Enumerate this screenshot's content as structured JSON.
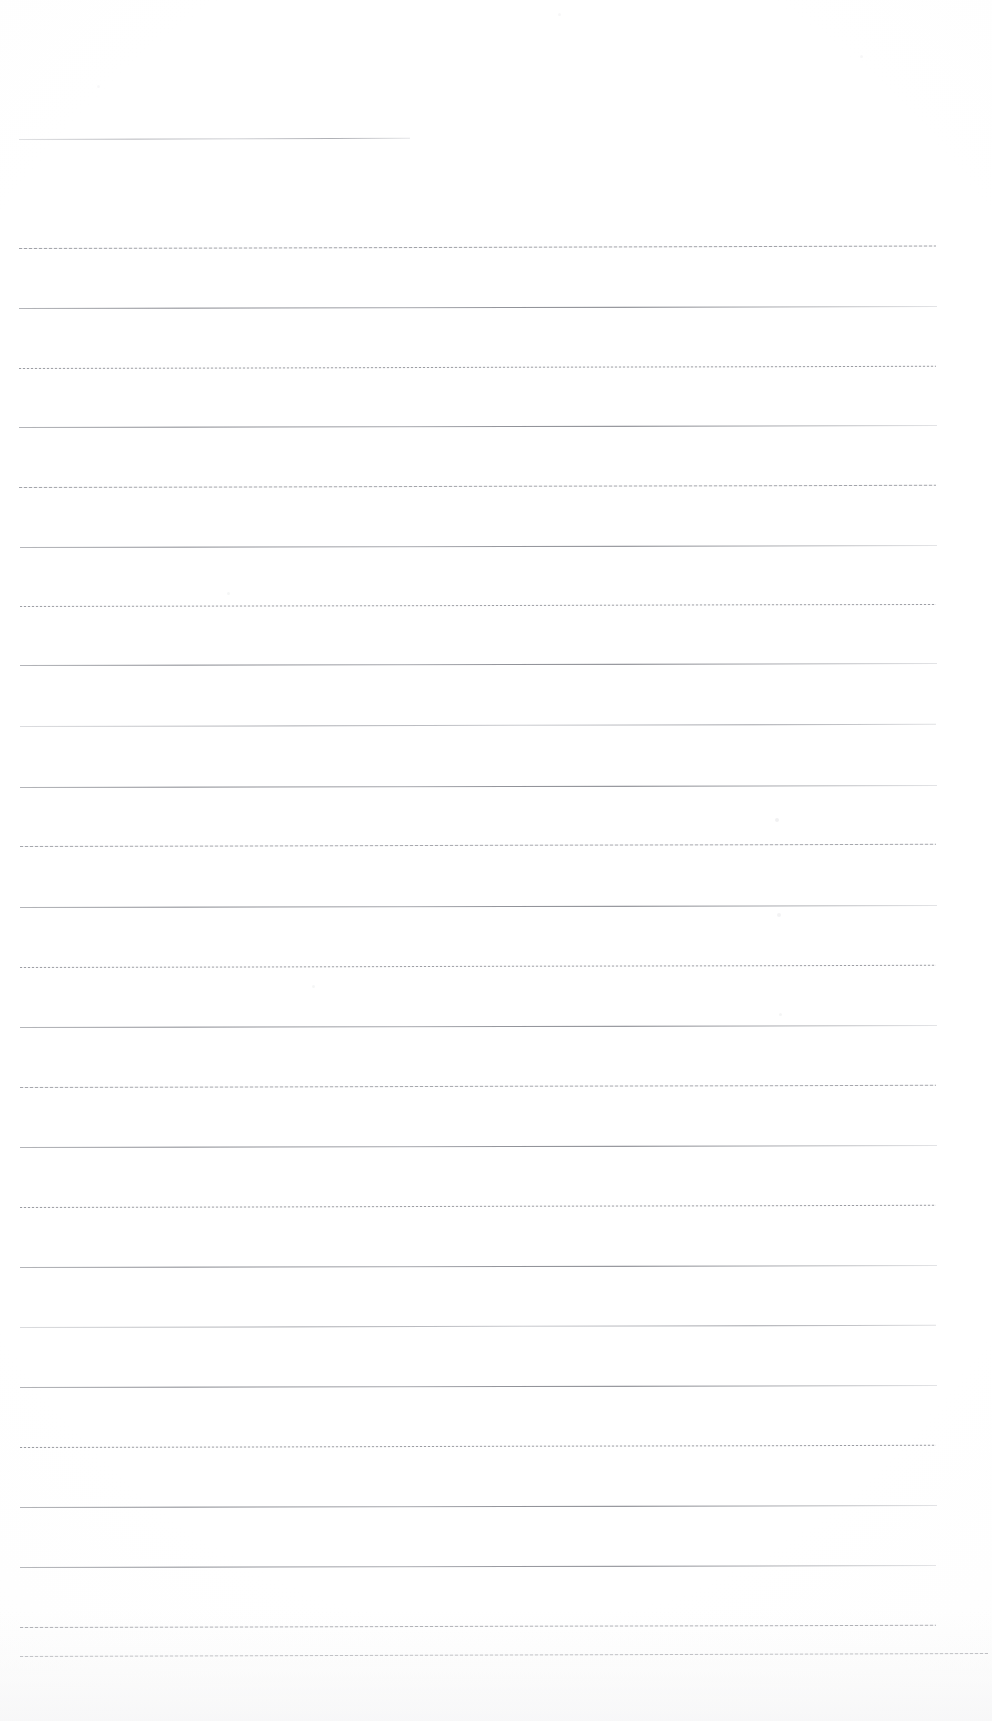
{
  "document": {
    "kind": "scanned-blank-ruled-page",
    "title": "",
    "background_color": "#ffffff",
    "rule_color": "#8a8c94",
    "page_width": 992,
    "page_height": 1721,
    "text_content": "",
    "visible_text": []
  },
  "rules": {
    "count": 28,
    "first_line_is_short": true,
    "short_line_right_edge": 410,
    "default_left_edge": 19,
    "default_right_edge": 937,
    "spacing": 60,
    "lines": [
      {
        "y": 139,
        "x1": 19,
        "x2": 410,
        "slant": -1.2,
        "texture": "fine",
        "opacity": 0.7
      },
      {
        "y": 248,
        "x1": 19,
        "x2": 936,
        "slant": -2.4,
        "texture": "mixed",
        "opacity": 0.85
      },
      {
        "y": 308,
        "x1": 19,
        "x2": 937,
        "slant": -2.0,
        "texture": "solid",
        "opacity": 0.95
      },
      {
        "y": 368,
        "x1": 19,
        "x2": 936,
        "slant": -2.2,
        "texture": "dotted",
        "opacity": 0.8
      },
      {
        "y": 427,
        "x1": 19,
        "x2": 937,
        "slant": -2.0,
        "texture": "solid",
        "opacity": 0.95
      },
      {
        "y": 487,
        "x1": 19,
        "x2": 936,
        "slant": -2.2,
        "texture": "mixed",
        "opacity": 0.82
      },
      {
        "y": 547,
        "x1": 20,
        "x2": 937,
        "slant": -2.0,
        "texture": "solid",
        "opacity": 0.92
      },
      {
        "y": 606,
        "x1": 20,
        "x2": 936,
        "slant": -2.1,
        "texture": "dotted",
        "opacity": 0.78
      },
      {
        "y": 665,
        "x1": 20,
        "x2": 937,
        "slant": -2.0,
        "texture": "solid",
        "opacity": 0.95
      },
      {
        "y": 726,
        "x1": 20,
        "x2": 936,
        "slant": -2.2,
        "texture": "fine",
        "opacity": 0.8
      },
      {
        "y": 787,
        "x1": 20,
        "x2": 937,
        "slant": -2.0,
        "texture": "solid",
        "opacity": 0.95
      },
      {
        "y": 846,
        "x1": 20,
        "x2": 936,
        "slant": -2.2,
        "texture": "mixed",
        "opacity": 0.8
      },
      {
        "y": 907,
        "x1": 20,
        "x2": 937,
        "slant": -2.0,
        "texture": "solid",
        "opacity": 0.95
      },
      {
        "y": 967,
        "x1": 20,
        "x2": 936,
        "slant": -2.2,
        "texture": "dotted",
        "opacity": 0.78
      },
      {
        "y": 1027,
        "x1": 20,
        "x2": 937,
        "slant": -2.0,
        "texture": "solid",
        "opacity": 0.93
      },
      {
        "y": 1087,
        "x1": 20,
        "x2": 936,
        "slant": -2.2,
        "texture": "mixed",
        "opacity": 0.8
      },
      {
        "y": 1147,
        "x1": 20,
        "x2": 937,
        "slant": -2.0,
        "texture": "solid",
        "opacity": 0.95
      },
      {
        "y": 1207,
        "x1": 20,
        "x2": 936,
        "slant": -2.2,
        "texture": "dotted",
        "opacity": 0.8
      },
      {
        "y": 1267,
        "x1": 20,
        "x2": 937,
        "slant": -2.0,
        "texture": "solid",
        "opacity": 0.95
      },
      {
        "y": 1327,
        "x1": 20,
        "x2": 936,
        "slant": -2.2,
        "texture": "fine",
        "opacity": 0.82
      },
      {
        "y": 1387,
        "x1": 20,
        "x2": 937,
        "slant": -2.0,
        "texture": "solid",
        "opacity": 0.95
      },
      {
        "y": 1447,
        "x1": 20,
        "x2": 936,
        "slant": -2.2,
        "texture": "dotted",
        "opacity": 0.8
      },
      {
        "y": 1507,
        "x1": 20,
        "x2": 937,
        "slant": -2.0,
        "texture": "solid",
        "opacity": 0.95
      },
      {
        "y": 1567,
        "x1": 20,
        "x2": 936,
        "slant": -2.0,
        "texture": "solid",
        "opacity": 0.9
      },
      {
        "y": 1627,
        "x1": 20,
        "x2": 936,
        "slant": -2.2,
        "texture": "mixed",
        "opacity": 0.8
      },
      {
        "y": 1656,
        "x1": 20,
        "x2": 988,
        "slant": -3.0,
        "texture": "mixed",
        "opacity": 0.85
      }
    ]
  },
  "artifacts": {
    "specks": [
      {
        "x": 775,
        "y": 818,
        "size": 4,
        "opacity": 0.1
      },
      {
        "x": 777,
        "y": 913,
        "size": 4,
        "opacity": 0.09
      },
      {
        "x": 779,
        "y": 1013,
        "size": 3,
        "opacity": 0.08
      },
      {
        "x": 227,
        "y": 592,
        "size": 3,
        "opacity": 0.07
      },
      {
        "x": 312,
        "y": 985,
        "size": 3,
        "opacity": 0.07
      },
      {
        "x": 558,
        "y": 13,
        "size": 3,
        "opacity": 0.06
      },
      {
        "x": 860,
        "y": 55,
        "size": 3,
        "opacity": 0.06
      },
      {
        "x": 97,
        "y": 85,
        "size": 3,
        "opacity": 0.05
      }
    ]
  }
}
